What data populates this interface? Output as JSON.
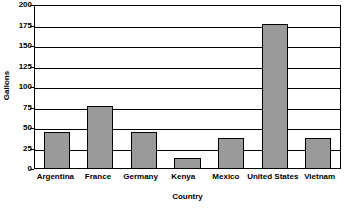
{
  "chart_data": {
    "type": "bar",
    "title": "",
    "xlabel": "Country",
    "ylabel": "Gallons",
    "categories": [
      "Argentina",
      "France",
      "Germany",
      "Kenya",
      "Mexico",
      "United States",
      "Vietnam"
    ],
    "values": [
      44,
      76,
      44,
      12,
      37,
      176,
      37
    ],
    "ylim": [
      0,
      200
    ],
    "ytick_step": 25,
    "yticks": [
      0,
      25,
      50,
      75,
      100,
      125,
      150,
      175,
      200
    ],
    "ytick_labels": [
      "0",
      "25",
      "50",
      "75",
      "100",
      "125",
      "150",
      "175",
      "200"
    ],
    "grid": true,
    "grid_axis": "y",
    "legend": false,
    "legend_position": "none",
    "bar_color": "#9a9a9a",
    "bar_edge_color": "#000000",
    "axis_color": "#000000",
    "background_color": "#ffffff"
  }
}
